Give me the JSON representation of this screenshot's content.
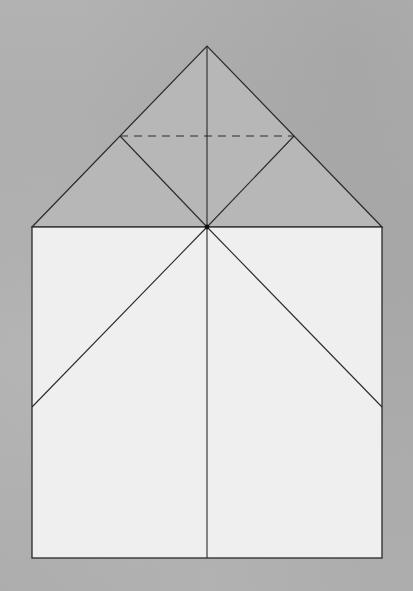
{
  "diagram": {
    "type": "origami-fold-diagram",
    "colors": {
      "background": "#aeaeae",
      "triangle_fill": "#b7b7b7",
      "square_fill": "#efefef",
      "line": "#2a2a2a"
    },
    "points": {
      "apex": [
        207,
        46
      ],
      "left_corner_top": [
        32,
        227
      ],
      "right_corner_top": [
        382,
        227
      ],
      "center": [
        207,
        227
      ],
      "left_mid": [
        120,
        136
      ],
      "right_mid": [
        294,
        136
      ],
      "left_side_hit": [
        32,
        407
      ],
      "right_side_hit": [
        382,
        407
      ],
      "bottom_left": [
        32,
        558
      ],
      "bottom_right": [
        382,
        558
      ],
      "bottom_center": [
        207,
        558
      ]
    },
    "shapes": [
      {
        "name": "roof-triangle",
        "kind": "polygon",
        "fill": "triangle_fill"
      },
      {
        "name": "base-square",
        "kind": "rect",
        "fill": "square_fill"
      }
    ],
    "lines": [
      {
        "name": "center-vertical-crease",
        "style": "solid",
        "from": "apex",
        "to": "bottom_center"
      },
      {
        "name": "left-inner-fold",
        "style": "solid",
        "from": "left_mid",
        "to": "center"
      },
      {
        "name": "right-inner-fold",
        "style": "solid",
        "from": "right_mid",
        "to": "center"
      },
      {
        "name": "left-lower-diagonal",
        "style": "solid",
        "from": "center",
        "to": "left_side_hit"
      },
      {
        "name": "right-lower-diagonal",
        "style": "solid",
        "from": "center",
        "to": "right_side_hit"
      },
      {
        "name": "valley-fold-dashed",
        "style": "dashed",
        "from": "left_mid",
        "to": "right_mid"
      }
    ],
    "markers": [
      {
        "name": "center-dot",
        "at": "center"
      }
    ]
  }
}
